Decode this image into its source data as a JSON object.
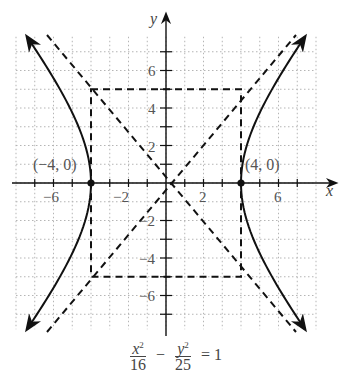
{
  "chart_data": {
    "type": "line",
    "title": "",
    "equation": "x²/16 − y²/25 = 1",
    "xlabel": "x",
    "ylabel": "y",
    "xlim": [
      -8,
      8
    ],
    "ylim": [
      -7.8,
      7.8
    ],
    "grid": true,
    "x_tick_labels": [
      "-6",
      "-2",
      "2",
      "6"
    ],
    "y_tick_labels": [
      "6",
      "4",
      "2",
      "-2",
      "-4",
      "-6"
    ],
    "series": [
      {
        "name": "hyperbola right branch",
        "style": "solid",
        "a": 4,
        "b": 5,
        "branch": "right",
        "vertex": [
          4,
          0
        ]
      },
      {
        "name": "hyperbola left branch",
        "style": "solid",
        "a": 4,
        "b": 5,
        "branch": "left",
        "vertex": [
          -4,
          0
        ]
      },
      {
        "name": "asymptote y = 5/4 x",
        "style": "dashed",
        "slope": 1.25
      },
      {
        "name": "asymptote y = -5/4 x",
        "style": "dashed",
        "slope": -1.25
      },
      {
        "name": "central rectangle",
        "style": "dashed",
        "corners": [
          [
            -4,
            5
          ],
          [
            4,
            5
          ],
          [
            4,
            -5
          ],
          [
            -4,
            -5
          ]
        ]
      }
    ],
    "points": [
      {
        "label": "(−4, 0)",
        "x": -4,
        "y": 0
      },
      {
        "label": "(4, 0)",
        "x": 4,
        "y": 0
      }
    ]
  },
  "labels": {
    "x_axis": "x",
    "y_axis": "y",
    "vertex_left": "(−4, 0)",
    "vertex_right": "(4, 0)",
    "ticks_x": {
      "m6": "−6",
      "m2": "−2",
      "p2": "2",
      "p6": "6"
    },
    "ticks_y": {
      "p6": "6",
      "p4": "4",
      "p2": "2",
      "m2": "−2",
      "m4": "−4",
      "m6": "−6"
    },
    "equation": {
      "x_num": "x",
      "x_den": "16",
      "minus": "−",
      "y_num": "y",
      "y_den": "25",
      "equals": "= 1",
      "sq": "2"
    }
  }
}
